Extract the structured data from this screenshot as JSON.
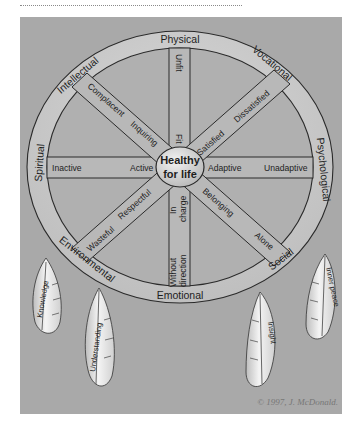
{
  "diagram": {
    "hub": {
      "line1": "Healthy",
      "line2": "for life"
    },
    "ring_labels": {
      "physical": "Physical",
      "vocational": "Vocational",
      "psychological": "Psychological",
      "social": "Social",
      "emotional": "Emotional",
      "environmental": "Environmental",
      "spiritual": "Spiritual",
      "intellectual": "Intellectual"
    },
    "spokes": {
      "physical": {
        "outer": "Unfit",
        "inner": "Fit"
      },
      "vocational": {
        "outer": "Dissatisfied",
        "inner": "Satisfied"
      },
      "psychological": {
        "outer": "Unadaptive",
        "inner": "Adaptive"
      },
      "social": {
        "outer": "Alone",
        "inner": "Belonging"
      },
      "emotional": {
        "outer_line1": "Without",
        "outer_line2": "direction",
        "inner_line1": "In",
        "inner_line2": "charge"
      },
      "environmental": {
        "outer": "Wasteful",
        "inner": "Respectful"
      },
      "spiritual": {
        "outer": "Inactive",
        "inner": "Active"
      },
      "intellectual": {
        "outer": "Complacent",
        "inner": "Inquiring"
      }
    },
    "feathers": {
      "knowledge": "Knowledge",
      "understanding": "Understanding",
      "insight": "Insight",
      "inner_peace": "Inner peace"
    },
    "copyright": "© 1997, J. McDonald."
  },
  "colors": {
    "background": "#a9a9a9",
    "ring_fill": "#c4c4c4",
    "spoke_fill": "#b4b4b4",
    "line": "#2a2a2a",
    "feather": "#e6e6e6"
  }
}
